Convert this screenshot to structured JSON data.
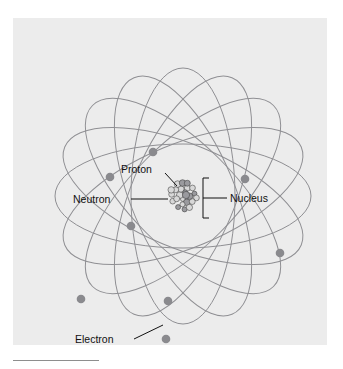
{
  "figure": {
    "background_color": "#ececec",
    "page_background": "#ffffff",
    "orbit_color": "#8f8f93",
    "electron_color": "#8a8a8e",
    "proton_color": "#9a9a9e",
    "neutron_color": "#d8d8d8",
    "label_color": "#111111",
    "leader_color": "#111111",
    "panel": {
      "x": 13,
      "y": 18,
      "width": 314,
      "height": 327
    }
  },
  "labels": {
    "proton": "Proton",
    "neutron": "Neutron",
    "nucleus": "Nucleus",
    "electron": "Electron"
  },
  "chart_data": {
    "type": "diagram",
    "subtitle": "",
    "xlabel": "",
    "ylabel": "",
    "legend_position": "inline-callouts",
    "grid": false,
    "center": {
      "x": 170,
      "y": 178
    },
    "orbit_count": 8,
    "orbit_rx": 128,
    "orbit_ry": 52,
    "orbit_rotations_deg": [
      0,
      22.5,
      45,
      67.5,
      90,
      112.5,
      135,
      157.5
    ],
    "nucleus": {
      "center": {
        "x": 170,
        "y": 178
      },
      "radius": 17,
      "proton_count": 9,
      "neutron_count": 22
    },
    "electrons": [
      {
        "id": 1,
        "x": 140,
        "y": 134
      },
      {
        "id": 2,
        "x": 97,
        "y": 159
      },
      {
        "id": 3,
        "x": 232,
        "y": 161
      },
      {
        "id": 4,
        "x": 118,
        "y": 208
      },
      {
        "id": 5,
        "x": 267,
        "y": 235
      },
      {
        "id": 6,
        "x": 68,
        "y": 281
      },
      {
        "id": 7,
        "x": 155,
        "y": 283
      },
      {
        "id": 8,
        "x": 153,
        "y": 321
      }
    ],
    "callouts": [
      {
        "label": "Proton",
        "text_anchor": {
          "x": 118,
          "y": 162
        },
        "target": {
          "x": 170,
          "y": 172
        }
      },
      {
        "label": "Neutron",
        "text_anchor": {
          "x": 88,
          "y": 182
        },
        "target": {
          "x": 155,
          "y": 182
        }
      },
      {
        "label": "Nucleus",
        "text_anchor": {
          "x": 217,
          "y": 182
        },
        "target": {
          "x": 196,
          "y": 182
        }
      },
      {
        "label": "Electron",
        "text_anchor": {
          "x": 79,
          "y": 325
        },
        "target": {
          "x": 153,
          "y": 321
        }
      }
    ]
  }
}
